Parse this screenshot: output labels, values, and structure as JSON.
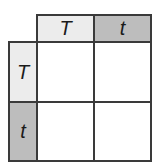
{
  "punnett": {
    "top_headers": [
      "T",
      "t"
    ],
    "left_headers": [
      "T",
      "t"
    ],
    "cells": [
      [
        "",
        ""
      ],
      [
        "",
        ""
      ]
    ],
    "colors": {
      "dominant_header_bg": "#ececec",
      "recessive_header_bg": "#bdbdbd",
      "border": "#3a3a3a",
      "cell_bg": "#ffffff"
    }
  }
}
